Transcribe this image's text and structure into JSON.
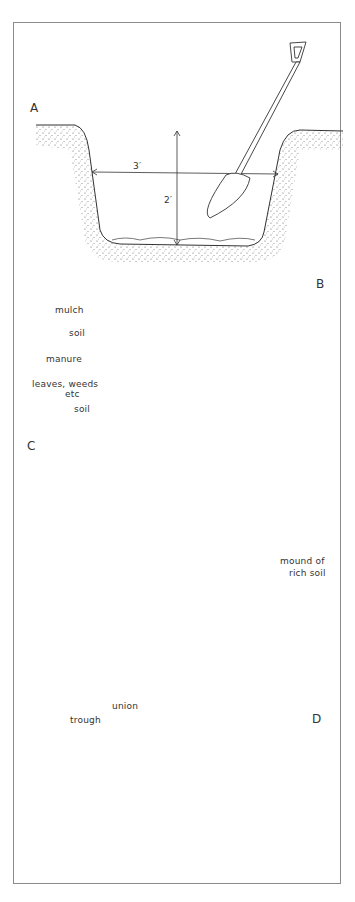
{
  "diagram": {
    "title": "",
    "panels": [
      {
        "id": "A",
        "letter": "A",
        "description": "Dig a hole with a spade",
        "labels": {
          "width": "3′",
          "depth": "2′"
        }
      },
      {
        "id": "B",
        "letter": "B",
        "description": "Layered fill of the hole",
        "layers": [
          {
            "label": "mulch"
          },
          {
            "label": "soil"
          },
          {
            "label": "manure"
          },
          {
            "label": "leaves, weeds",
            "label2": "etc"
          },
          {
            "label": "soil"
          }
        ]
      },
      {
        "id": "C",
        "letter": "C",
        "description": "Mound of rich soil in hole",
        "labels": {
          "mound1": "mound of",
          "mound2": "rich soil"
        }
      },
      {
        "id": "D",
        "letter": "D",
        "description": "Tree planted with roots spread",
        "labels": {
          "union": "union",
          "trough": "trough"
        }
      }
    ]
  },
  "colors": {
    "ink": "#333333",
    "frame": "#8a8a8a",
    "background": "#ffffff"
  }
}
